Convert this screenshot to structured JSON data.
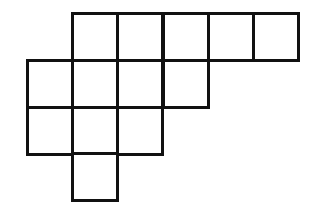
{
  "diagram": {
    "type": "polyomino-grid",
    "cell_count": 13,
    "line_color": "#111111",
    "background": "#ffffff",
    "origin": {
      "x": 27,
      "y": 13
    },
    "cell_width": 45.2,
    "cell_height": 46.8,
    "rows": [
      {
        "row": 0,
        "columns": [
          1,
          2,
          3,
          4,
          5
        ]
      },
      {
        "row": 1,
        "columns": [
          0,
          1,
          2,
          3
        ]
      },
      {
        "row": 2,
        "columns": [
          0,
          1,
          2
        ]
      },
      {
        "row": 3,
        "columns": [
          1
        ]
      }
    ]
  }
}
